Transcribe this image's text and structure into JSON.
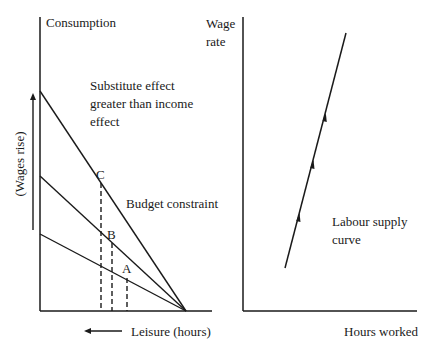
{
  "left_panel": {
    "y_axis_label": "Consumption",
    "x_axis_label": "Leisure (hours)",
    "wage_arrow_label": "(Wages rise)",
    "annotation": [
      "Substitute effect",
      "greater than income",
      "effect"
    ],
    "budget_label": "Budget constraint",
    "points": [
      {
        "label": "C"
      },
      {
        "label": "B"
      },
      {
        "label": "A"
      }
    ]
  },
  "right_panel": {
    "y_axis_label": [
      "Wage",
      "rate"
    ],
    "x_axis_label": "Hours worked",
    "curve_label": [
      "Labour supply",
      "curve"
    ]
  },
  "colors": {
    "ink": "#1a1a1a",
    "background": "#ffffff"
  }
}
